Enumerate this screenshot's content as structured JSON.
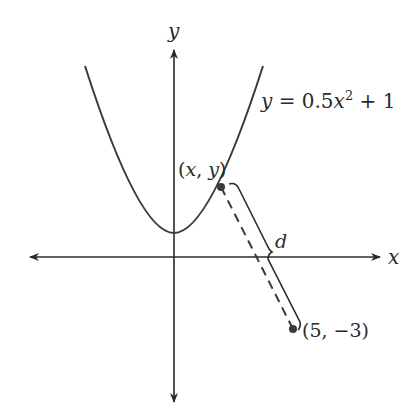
{
  "diagram": {
    "axes": {
      "x_label": "x",
      "y_label": "y"
    },
    "curve": {
      "equation_lhs": "y",
      "equation_eq": " = 0.5",
      "equation_var": "x",
      "equation_exp": "2",
      "equation_rest": " + 1",
      "vertex": [
        0,
        1
      ]
    },
    "points": [
      {
        "label": "(x, y)",
        "lparen": "(",
        "x": "x",
        "sep": ", ",
        "y": "y",
        "rparen": ")"
      },
      {
        "label": "(5, −3)"
      }
    ],
    "distance_label": "d",
    "colors": {
      "stroke": "#2a2a2a",
      "point": "#3a3a3a",
      "background": "#ffffff"
    }
  }
}
